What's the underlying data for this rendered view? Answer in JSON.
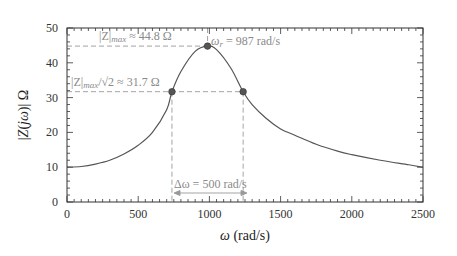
{
  "chart_data": {
    "type": "line",
    "title": "",
    "xlabel": "ω (rad/s)",
    "ylabel": "|Z(jω)| Ω",
    "xlim": [
      0,
      2500
    ],
    "ylim": [
      0,
      50
    ],
    "xticks": [
      0,
      500,
      1000,
      1500,
      2000,
      2500
    ],
    "yticks": [
      0,
      10,
      20,
      30,
      40,
      50
    ],
    "grid": false,
    "series": [
      {
        "name": "|Z(jω)|",
        "x": [
          0,
          100,
          200,
          300,
          400,
          500,
          600,
          700,
          737,
          800,
          900,
          987,
          1050,
          1150,
          1237,
          1300,
          1400,
          1500,
          1600,
          1750,
          1900,
          2000,
          2200,
          2400,
          2500
        ],
        "y": [
          10,
          10.2,
          10.9,
          12,
          13.8,
          16.3,
          20,
          26.5,
          31.7,
          37.5,
          43.3,
          44.8,
          43.8,
          38.5,
          31.7,
          28,
          24,
          21,
          19.2,
          16.6,
          14.6,
          13.6,
          12,
          10.7,
          10
        ]
      }
    ],
    "markers": [
      {
        "x": 737,
        "y": 31.7
      },
      {
        "x": 987,
        "y": 44.8
      },
      {
        "x": 1237,
        "y": 31.7
      }
    ],
    "annotations": {
      "zmax": "|Z|max ≈ 44.8 Ω",
      "zmax_sub": "max",
      "zmax_val": " ≈ 44.8 Ω",
      "half_power": "|Z|max/√2 ≈ 31.7 Ω",
      "half_power_val": " ≈ 31.7 Ω",
      "omega_r": "ωr = 987 rad/s",
      "omega_r_val": " = 987 rad/s",
      "bandwidth": "Δω = 500 rad/s"
    }
  }
}
